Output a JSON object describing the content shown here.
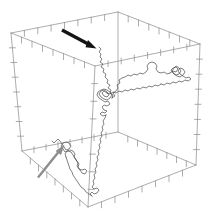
{
  "figure": {
    "type": "3d-line-trajectory",
    "width": 215,
    "height": 224,
    "background_color": "#ffffff"
  },
  "chart_data": {
    "type": "line",
    "title": "",
    "xlabel": "",
    "ylabel": "",
    "zlabel": "",
    "projection": "3d-wireframe-box",
    "grid": false,
    "legend_position": "none",
    "axis_box": {
      "stroke_color": "#8a8a8a",
      "stroke_width": 0.7,
      "tick_color": "#8a8a8a",
      "tick_count_per_edge": 8,
      "vertices_2d": {
        "back_top_left": [
          11,
          33
        ],
        "back_top_right": [
          118,
          12
        ],
        "front_top_right": [
          200,
          44
        ],
        "front_top_left": [
          95,
          66
        ],
        "back_bottom_left": [
          22,
          151
        ],
        "back_bottom_right": [
          118,
          132
        ],
        "front_bottom_right": [
          196,
          165
        ],
        "front_bottom_left": [
          88,
          207
        ]
      }
    },
    "series": [
      {
        "name": "chain-trajectory",
        "color": "#4a4a4a",
        "stroke_width": 0.7,
        "description": "self-avoiding random walk with two dense globular clusters and one open loop"
      }
    ],
    "annotations": [
      {
        "name": "black-arrow",
        "color": "#141414",
        "points_to": "chain segment entering the box from the top rear face",
        "tail_2d": [
          62,
          30
        ],
        "head_2d": [
          95,
          48
        ],
        "stroke_width": 3.4,
        "head_size": 9
      },
      {
        "name": "gray-arrow",
        "color": "#8d8d8d",
        "points_to": "open loop in the lower-left region of the chain",
        "tail_2d": [
          38,
          177
        ],
        "head_2d": [
          64,
          145
        ],
        "stroke_width": 2.4,
        "head_size": 8
      }
    ]
  }
}
